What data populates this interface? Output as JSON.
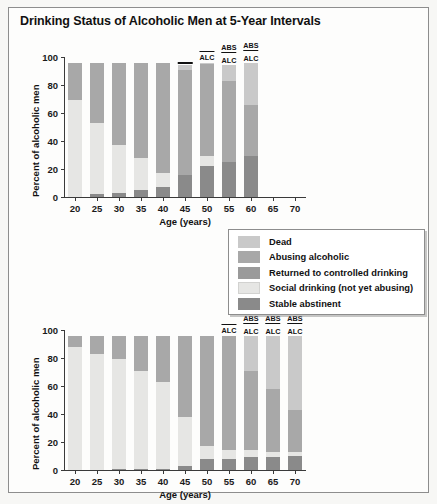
{
  "figure": {
    "title": "Drinking Status of Alcoholic Men at 5-Year Intervals"
  },
  "legend": {
    "items": [
      {
        "label": "Dead",
        "color": "#c9c9c9"
      },
      {
        "label": "Abusing alcoholic",
        "color": "#a8a8a8"
      },
      {
        "label": "Returned to controlled drinking",
        "color": "#9a9a9a"
      },
      {
        "label": "Social drinking (not yet abusing)",
        "color": "#e6e6e4"
      },
      {
        "label": "Stable abstinent",
        "color": "#8a8a8a"
      }
    ]
  },
  "chart_data": [
    {
      "type": "bar",
      "id": "chart-top",
      "stacked": true,
      "title": "",
      "xlabel": "Age (years)",
      "ylabel": "Percent of alcoholic men",
      "categories": [
        "20",
        "25",
        "30",
        "35",
        "40",
        "45",
        "50",
        "55",
        "60",
        "65",
        "70"
      ],
      "ylim": [
        0,
        100
      ],
      "yticks": [
        0,
        20,
        40,
        60,
        80,
        100
      ],
      "grid": false,
      "legend_position": "center-right",
      "series": [
        {
          "name": "Stable abstinent",
          "color": "#8a8a8a",
          "values": [
            0,
            2,
            3,
            5,
            7,
            16,
            22,
            25,
            29,
            null,
            null
          ]
        },
        {
          "name": "Social drinking (not yet abusing)",
          "color": "#e6e6e4",
          "values": [
            69,
            51,
            34,
            23,
            10,
            0,
            7,
            0,
            0,
            null,
            null
          ]
        },
        {
          "name": "Returned to controlled drinking",
          "color": "#9a9a9a",
          "values": [
            0,
            0,
            0,
            0,
            0,
            0,
            0,
            0,
            0,
            null,
            null
          ]
        },
        {
          "name": "Abusing alcoholic",
          "color": "#a8a8a8",
          "values": [
            27,
            43,
            59,
            68,
            79,
            75,
            66,
            58,
            37,
            null,
            null
          ]
        },
        {
          "name": "Dead",
          "color": "#c9c9c9",
          "values": [
            0,
            0,
            0,
            0,
            0,
            3,
            1,
            11,
            30,
            null,
            null
          ]
        }
      ],
      "annotations": [
        {
          "category": "45",
          "text": "",
          "rule": true
        },
        {
          "category": "50",
          "text": "ALC",
          "rule_above": true
        },
        {
          "category": "55",
          "text": "ABS",
          "second": "ALC"
        },
        {
          "category": "60",
          "text": "ABS",
          "second": "ALC"
        }
      ]
    },
    {
      "type": "bar",
      "id": "chart-bottom",
      "stacked": true,
      "title": "",
      "xlabel": "Age (years)",
      "ylabel": "Percent of alcoholic men",
      "categories": [
        "20",
        "25",
        "30",
        "35",
        "40",
        "45",
        "50",
        "55",
        "60",
        "65",
        "70"
      ],
      "ylim": [
        0,
        100
      ],
      "yticks": [
        0,
        20,
        40,
        60,
        80,
        100
      ],
      "grid": false,
      "series": [
        {
          "name": "Stable abstinent",
          "color": "#8a8a8a",
          "values": [
            0,
            0,
            1,
            1,
            1,
            3,
            8,
            8,
            9,
            9,
            10
          ]
        },
        {
          "name": "Social drinking (not yet abusing)",
          "color": "#e6e6e4",
          "values": [
            88,
            83,
            78,
            70,
            62,
            35,
            9,
            6,
            5,
            4,
            3
          ]
        },
        {
          "name": "Returned to controlled drinking",
          "color": "#9a9a9a",
          "values": [
            0,
            0,
            0,
            0,
            0,
            0,
            0,
            0,
            0,
            0,
            0
          ]
        },
        {
          "name": "Abusing alcoholic",
          "color": "#a8a8a8",
          "values": [
            8,
            13,
            17,
            25,
            33,
            58,
            79,
            82,
            57,
            45,
            30
          ]
        },
        {
          "name": "Dead",
          "color": "#c9c9c9",
          "values": [
            0,
            0,
            0,
            0,
            0,
            0,
            0,
            0,
            25,
            38,
            53
          ]
        }
      ],
      "annotations": [
        {
          "category": "55",
          "text": "ALC",
          "rule_above": true
        },
        {
          "category": "60",
          "text": "ABS",
          "second": "ALC"
        },
        {
          "category": "65",
          "text": "ABS",
          "second": "ALC"
        },
        {
          "category": "70",
          "text": "ABS",
          "second": "ALC"
        }
      ]
    }
  ]
}
